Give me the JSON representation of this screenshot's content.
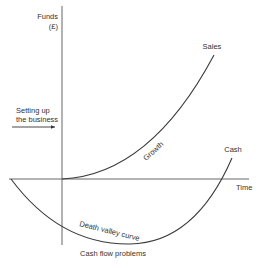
{
  "diagram": {
    "y_axis_label": "Funds",
    "y_axis_unit": "(£)",
    "x_axis_label": "Time",
    "curves": [
      {
        "name": "Sales",
        "label": "Sales",
        "annotation": "Growth"
      },
      {
        "name": "Cash",
        "label": "Cash",
        "annotation": "Death valley curve"
      }
    ],
    "setup_label_line1": "Setting up",
    "setup_label_line2": "the business",
    "bottom_label": "Cash flow problems",
    "colors": {
      "line": "#3a3a3a",
      "axis": "#555555",
      "text": "#333333",
      "background": "#ffffff"
    }
  }
}
